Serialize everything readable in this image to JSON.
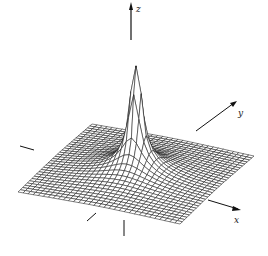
{
  "chart_data": {
    "type": "surface-3d-wireframe",
    "title": "",
    "axes": {
      "x": {
        "label": "x"
      },
      "y": {
        "label": "y"
      },
      "z": {
        "label": "z"
      }
    },
    "surface": {
      "description": "Sharp central singular peak over square domain, flat toward edges",
      "function": "z = a / sqrt(u^2 + v^2 + eps)",
      "grid_size": 32,
      "domain_u": [
        -1,
        1
      ],
      "domain_v": [
        -1,
        1
      ],
      "peak_clip": 1.0,
      "eps": 0.0004,
      "scale": 0.05
    },
    "projection": {
      "corner_left": [
        18,
        196
      ],
      "corner_front": [
        180,
        228
      ],
      "corner_right": [
        254,
        160
      ],
      "corner_back": [
        92,
        128
      ],
      "z_pixels": 118,
      "z_origin": [
        132,
        176
      ]
    },
    "colors": {
      "line": "#1a1a1a",
      "background": "#ffffff",
      "fill": "#ffffff"
    }
  },
  "labels": {
    "x": "x",
    "y": "y",
    "z": "z"
  }
}
